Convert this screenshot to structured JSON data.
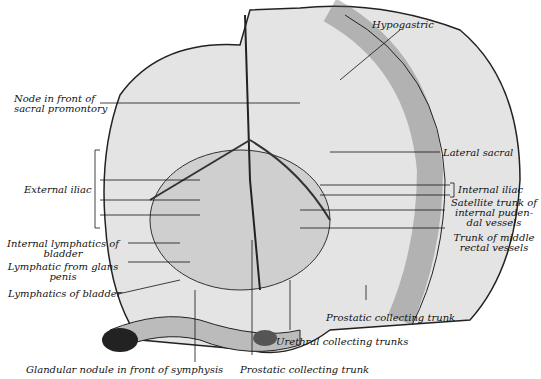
{
  "labels": {
    "hypogastric": "Hypogastric",
    "node_front_1": "Node in front of",
    "node_front_2": "sacral promontory",
    "lateral_sacral": "Lateral sacral",
    "external_iliac": "External iliac",
    "internal_iliac": "Internal iliac",
    "satellite_1": "Satellite trunk of",
    "satellite_2": "internal puden-",
    "satellite_3": "dal vessels",
    "middle_rectal_1": "Trunk of middle",
    "middle_rectal_2": "rectal vessels",
    "internal_lymph_1": "Internal lymphatics of",
    "internal_lymph_2": "bladder",
    "glans_1": "Lymphatic from glans",
    "glans_2": "penis",
    "lymph_bladder": "Lymphatics of bladder",
    "prostatic_right": "Prostatic collecting trunk",
    "urethral": "Urethral collecting trunks",
    "glandular": "Glandular nodule in front of symphysis",
    "prostatic_bottom": "Prostatic collecting trunk"
  },
  "colors": {
    "ink": "#111111",
    "tissue": "#d8d8d8",
    "dark": "#3a3a3a"
  }
}
